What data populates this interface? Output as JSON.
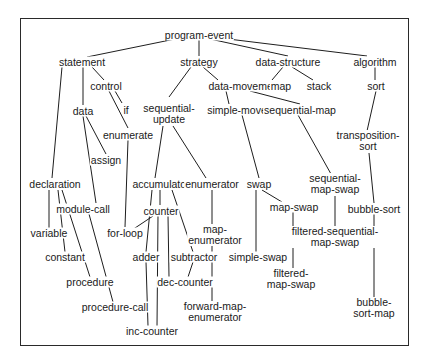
{
  "diagram": {
    "type": "hierarchy",
    "nodes": [
      {
        "id": "program-event",
        "lines": [
          "program-event"
        ],
        "x": 199,
        "y": 35
      },
      {
        "id": "statement",
        "lines": [
          "statement"
        ],
        "x": 82,
        "y": 62
      },
      {
        "id": "strategy",
        "lines": [
          "strategy"
        ],
        "x": 199,
        "y": 62
      },
      {
        "id": "data-structure",
        "lines": [
          "data-structure"
        ],
        "x": 288,
        "y": 62
      },
      {
        "id": "algorithm",
        "lines": [
          "algorithm"
        ],
        "x": 375,
        "y": 62
      },
      {
        "id": "control",
        "lines": [
          "control"
        ],
        "x": 106,
        "y": 86
      },
      {
        "id": "data-movement",
        "lines": [
          "data-movement"
        ],
        "x": 245,
        "y": 86
      },
      {
        "id": "map",
        "lines": [
          "map"
        ],
        "x": 281,
        "y": 86
      },
      {
        "id": "stack",
        "lines": [
          "stack"
        ],
        "x": 319,
        "y": 86
      },
      {
        "id": "sort",
        "lines": [
          "sort"
        ],
        "x": 376,
        "y": 86
      },
      {
        "id": "data",
        "lines": [
          "data"
        ],
        "x": 83,
        "y": 111
      },
      {
        "id": "if",
        "lines": [
          "if"
        ],
        "x": 126,
        "y": 110
      },
      {
        "id": "sequential-update",
        "lines": [
          "sequential-",
          "update"
        ],
        "x": 169,
        "y": 114
      },
      {
        "id": "simple-move",
        "lines": [
          "simple-move"
        ],
        "x": 237,
        "y": 110
      },
      {
        "id": "sequential-map",
        "lines": [
          "sequential-map"
        ],
        "x": 300,
        "y": 110
      },
      {
        "id": "enumerate",
        "lines": [
          "enumerate"
        ],
        "x": 128,
        "y": 135
      },
      {
        "id": "assign",
        "lines": [
          "assign"
        ],
        "x": 106,
        "y": 160
      },
      {
        "id": "transposition-sort",
        "lines": [
          "transposition-",
          "sort"
        ],
        "x": 368,
        "y": 141
      },
      {
        "id": "declaration",
        "lines": [
          "declaration"
        ],
        "x": 55,
        "y": 184
      },
      {
        "id": "accumulator",
        "lines": [
          "accumulator"
        ],
        "x": 161,
        "y": 184
      },
      {
        "id": "enumerator",
        "lines": [
          "enumerator"
        ],
        "x": 212,
        "y": 184
      },
      {
        "id": "swap",
        "lines": [
          "swap"
        ],
        "x": 259,
        "y": 184
      },
      {
        "id": "sequential-map-swap",
        "lines": [
          "sequential-",
          "map-swap"
        ],
        "x": 335,
        "y": 184
      },
      {
        "id": "module-call",
        "lines": [
          "module-call"
        ],
        "x": 83,
        "y": 209
      },
      {
        "id": "counter",
        "lines": [
          "counter"
        ],
        "x": 161,
        "y": 211
      },
      {
        "id": "map-swap",
        "lines": [
          "map-swap"
        ],
        "x": 294,
        "y": 207
      },
      {
        "id": "bubble-sort",
        "lines": [
          "bubble-sort"
        ],
        "x": 374,
        "y": 209
      },
      {
        "id": "variable",
        "lines": [
          "variable"
        ],
        "x": 49,
        "y": 233
      },
      {
        "id": "for-loop",
        "lines": [
          "for-loop"
        ],
        "x": 125,
        "y": 233
      },
      {
        "id": "map-enumerator",
        "lines": [
          "map-",
          "enumerator"
        ],
        "x": 215,
        "y": 235
      },
      {
        "id": "constant",
        "lines": [
          "constant"
        ],
        "x": 65,
        "y": 257
      },
      {
        "id": "adder",
        "lines": [
          "adder"
        ],
        "x": 146,
        "y": 257
      },
      {
        "id": "subtractor",
        "lines": [
          "subtractor"
        ],
        "x": 194,
        "y": 257
      },
      {
        "id": "filtered-sequential-map-swap",
        "lines": [
          "filtered-sequential-",
          "map-swap"
        ],
        "x": 335,
        "y": 237
      },
      {
        "id": "procedure",
        "lines": [
          "procedure"
        ],
        "x": 90,
        "y": 282
      },
      {
        "id": "dec-counter",
        "lines": [
          "dec-counter"
        ],
        "x": 185,
        "y": 282
      },
      {
        "id": "simple-swap",
        "lines": [
          "simple-swap"
        ],
        "x": 258,
        "y": 257
      },
      {
        "id": "filtered-map-swap",
        "lines": [
          "filtered-",
          "map-swap"
        ],
        "x": 291,
        "y": 279
      },
      {
        "id": "procedure-call",
        "lines": [
          "procedure-call"
        ],
        "x": 115,
        "y": 307
      },
      {
        "id": "forward-map-enumerator",
        "lines": [
          "forward-map-",
          "enumerator"
        ],
        "x": 215,
        "y": 312
      },
      {
        "id": "bubble-sort-map",
        "lines": [
          "bubble-",
          "sort-map"
        ],
        "x": 374,
        "y": 308
      },
      {
        "id": "inc-counter",
        "lines": [
          "inc-counter"
        ],
        "x": 152,
        "y": 331
      }
    ],
    "edges": [
      [
        180,
        38,
        87,
        57
      ],
      [
        199,
        40,
        199,
        56
      ],
      [
        210,
        39,
        288,
        56
      ],
      [
        220,
        38,
        367,
        56
      ],
      [
        92,
        67,
        104,
        80
      ],
      [
        83,
        67,
        83,
        105
      ],
      [
        62,
        67,
        52,
        178
      ],
      [
        191,
        67,
        169,
        97
      ],
      [
        203,
        67,
        218,
        80
      ],
      [
        283,
        67,
        272,
        80
      ],
      [
        292,
        67,
        313,
        80
      ],
      [
        375,
        67,
        375,
        80
      ],
      [
        376,
        91,
        367,
        131
      ],
      [
        226,
        91,
        229,
        104
      ],
      [
        250,
        91,
        300,
        104
      ],
      [
        115,
        91,
        122,
        103
      ],
      [
        109,
        91,
        128,
        128
      ],
      [
        86,
        116,
        106,
        154
      ],
      [
        83,
        116,
        96,
        203
      ],
      [
        128,
        140,
        125,
        227
      ],
      [
        163,
        126,
        155,
        178
      ],
      [
        173,
        126,
        206,
        178
      ],
      [
        242,
        115,
        259,
        178
      ],
      [
        298,
        115,
        331,
        174
      ],
      [
        369,
        153,
        374,
        203
      ],
      [
        374,
        214,
        374,
        298
      ],
      [
        335,
        196,
        335,
        230
      ],
      [
        262,
        190,
        282,
        202
      ],
      [
        293,
        212,
        293,
        271
      ],
      [
        256,
        190,
        256,
        252
      ],
      [
        212,
        190,
        212,
        228
      ],
      [
        212,
        246,
        212,
        306
      ],
      [
        160,
        190,
        160,
        205
      ],
      [
        172,
        190,
        193,
        252
      ],
      [
        193,
        262,
        188,
        277
      ],
      [
        152,
        190,
        146,
        252
      ],
      [
        146,
        262,
        148,
        326
      ],
      [
        153,
        216,
        132,
        230
      ],
      [
        158,
        216,
        157,
        326
      ],
      [
        168,
        216,
        169,
        277
      ],
      [
        49,
        190,
        49,
        228
      ],
      [
        58,
        190,
        65,
        252
      ],
      [
        62,
        190,
        90,
        277
      ],
      [
        89,
        214,
        113,
        302
      ]
    ]
  }
}
